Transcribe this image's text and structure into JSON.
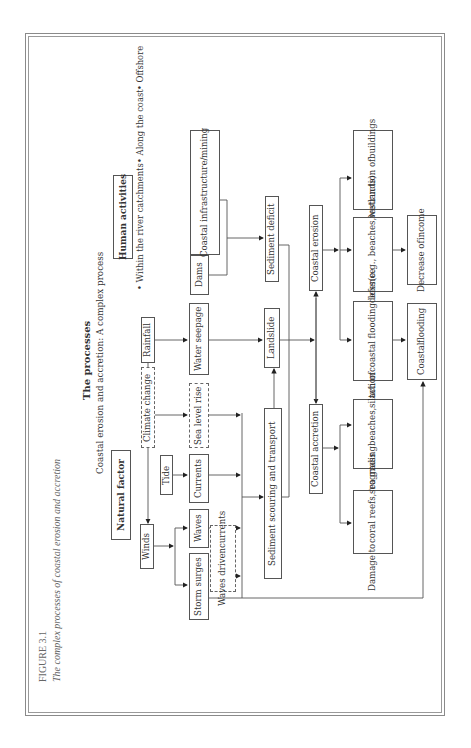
{
  "figure": {
    "label": "FIGURE 3.1",
    "caption": "The complex processes of coastal erosion and accretion"
  },
  "header": {
    "title": "The processes",
    "subtitle": "Coastal erosion and accretion: A complex process"
  },
  "groups": {
    "natural": "Natural factor",
    "human": "Human activities",
    "human_bullets": [
      "• Within the river catchments",
      "• Along the coast",
      "• Offshore"
    ]
  },
  "nodes": {
    "winds": "Winds",
    "climate_change": "Climate change",
    "rainfall": "Rainfall",
    "tide": "Tide",
    "storm_surges": "Storm surges",
    "waves": "Waves",
    "waves_driven_currents": [
      "Waves driven",
      "currents"
    ],
    "currents": "Currents",
    "sea_level_rise": "Sea level rise",
    "water_seepage": "Water seepage",
    "dams": "Dams",
    "coastal_infrastructure": [
      "Coastal infrastructure/",
      "mining"
    ],
    "sediment_scouring": "Sediment scouring and transport",
    "landslide": "Landslide",
    "sediment_deficit": "Sediment deficit",
    "coastal_accretion": "Coastal accretion",
    "coastal_erosion": "Coastal erosion",
    "destruction_buildings": [
      "Destruction of",
      "buildings"
    ],
    "habitat_loss": [
      "Habitat loss",
      "(e.g., beaches,",
      "wetlands)"
    ],
    "breach_defence": [
      "Breach of",
      "coastal flooding",
      "defence"
    ],
    "prograding": [
      "Prograding",
      "beaches,",
      "siltation"
    ],
    "damage_reefs": [
      "Damage to",
      "coral reefs,",
      "sea grass"
    ],
    "decrease_income": [
      "Decrease of",
      "income"
    ],
    "coastal_flooding": [
      "Coastal",
      "flooding"
    ]
  },
  "edge_style": {
    "line_color": "#555555",
    "dashed_nodes": [
      "climate_change",
      "sea_level_rise",
      "waves_driven_currents"
    ]
  }
}
